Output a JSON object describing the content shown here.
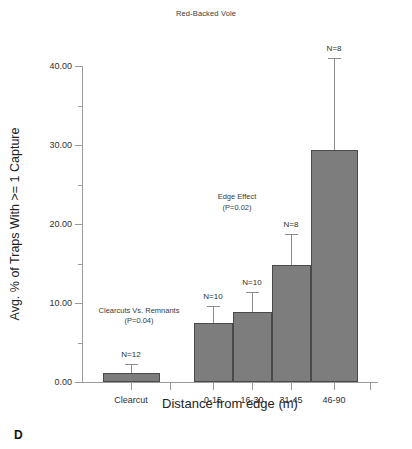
{
  "figure": {
    "panel_letter": "D",
    "title": "Red-Backed Vole"
  },
  "chart_data": {
    "type": "bar",
    "title": "Red-Backed Vole",
    "xlabel": "Distance from edge (m)",
    "ylabel": "Avg. % of Traps With >= 1 Capture",
    "categories": [
      "Clearcut",
      "0-15",
      "16-30",
      "31-45",
      "46-90"
    ],
    "values": [
      1.2,
      7.5,
      8.9,
      14.8,
      29.4
    ],
    "errors_upper": [
      1.1,
      2.1,
      2.5,
      3.9,
      11.6
    ],
    "sample_sizes": [
      "N=12",
      "N=10",
      "N=10",
      "N=8",
      "N=8"
    ],
    "ylim": [
      0,
      40
    ],
    "yticks_major": [
      "0.00",
      "10.00",
      "20.00",
      "30.00",
      "40.00"
    ],
    "ytick_values": [
      0,
      10,
      20,
      30,
      40
    ],
    "ytick_minor_values": [
      5,
      15,
      25,
      35
    ],
    "grid": false,
    "legend": "none",
    "bar_color": "#7d7d7d",
    "bar_edge_color": "#4a4a4a",
    "axis_color": "#9a9a9a",
    "annotations": [
      {
        "id": "clearcuts-vs-remnants",
        "line1": "Clearcuts Vs. Remnants",
        "line2": "(P=0.04)",
        "x_value": 0.45,
        "y_value": 9.6
      },
      {
        "id": "edge-effect",
        "line1": "Edge Effect",
        "line2": "(P=0.02)",
        "x_value": 2.35,
        "y_value": 24.0
      }
    ]
  },
  "axes": {
    "y_label": "Avg. % of Traps With >= 1 Capture",
    "x_label": "Distance from edge (m)",
    "y_ticks": [
      {
        "label": "0.00",
        "value": 0
      },
      {
        "label": "10.00",
        "value": 10
      },
      {
        "label": "20.00",
        "value": 20
      },
      {
        "label": "30.00",
        "value": 30
      },
      {
        "label": "40.00",
        "value": 40
      }
    ],
    "x_ticks": [
      {
        "label": "Clearcut",
        "index": 0
      },
      {
        "label": "0-15",
        "index": 1
      },
      {
        "label": "16-30",
        "index": 2
      },
      {
        "label": "31-45",
        "index": 3
      },
      {
        "label": "46-90",
        "index": 4
      }
    ]
  }
}
